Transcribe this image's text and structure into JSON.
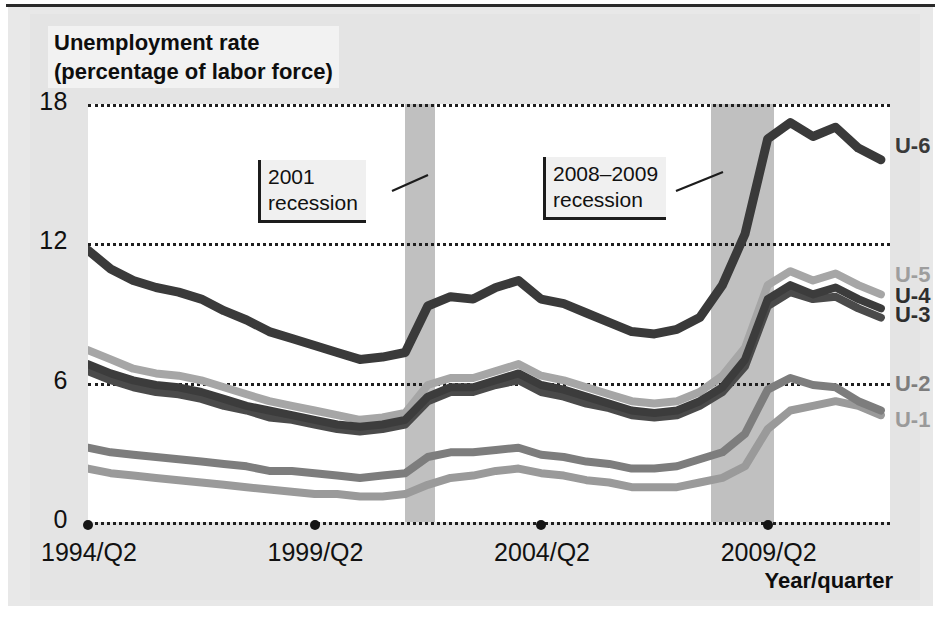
{
  "title": {
    "line1": "Unemployment rate",
    "line2": "(percentage of labor force)"
  },
  "axis": {
    "x_title": "Year/quarter",
    "y_ticks": [
      "0",
      "6",
      "12",
      "18"
    ],
    "x_ticks": [
      "1994/Q2",
      "1999/Q2",
      "2004/Q2",
      "2009/Q2"
    ]
  },
  "annotations": [
    {
      "line1": "2001",
      "line2": "recession"
    },
    {
      "line1": "2008–2009",
      "line2": "recession"
    }
  ],
  "series_labels": [
    "U-6",
    "U-5",
    "U-4",
    "U-3",
    "U-2",
    "U-1"
  ],
  "colors": {
    "u1": "#9a9a9a",
    "u2": "#7d7d7d",
    "u3": "#4a4a4a",
    "u4": "#3c3c3c",
    "u5": "#a6a6a6",
    "u6": "#3a3a3a",
    "recession_band": "#c0c0c0",
    "plot_background": "#ffffff",
    "figure_background": "#e8e8e8",
    "gridline": "#1f1f1f",
    "text": "#111111"
  },
  "chart_data": {
    "type": "line",
    "title": "Unemployment rate (percentage of labor force)",
    "xlabel": "Year/quarter",
    "ylabel": "Unemployment rate (percentage of labor force)",
    "ylim": [
      0,
      18
    ],
    "xlim": [
      "1994/Q2",
      "2011/Q4"
    ],
    "grid": true,
    "gridlines_y": [
      0,
      6,
      12,
      18
    ],
    "legend_position": "right-inline-end-labels",
    "x_tick_labels": [
      "1994/Q2",
      "1999/Q2",
      "2004/Q2",
      "2009/Q2"
    ],
    "x_tick_values": [
      1994.25,
      1999.25,
      2004.25,
      2009.25
    ],
    "shaded_regions": [
      {
        "label": "2001 recession",
        "start": 2001.25,
        "end": 2001.9
      },
      {
        "label": "2008-2009 recession",
        "start": 2008.0,
        "end": 2009.4
      }
    ],
    "x": [
      1994.25,
      1994.75,
      1995.25,
      1995.75,
      1996.25,
      1996.75,
      1997.25,
      1997.75,
      1998.25,
      1998.75,
      1999.25,
      1999.75,
      2000.25,
      2000.75,
      2001.25,
      2001.75,
      2002.25,
      2002.75,
      2003.25,
      2003.75,
      2004.25,
      2004.75,
      2005.25,
      2005.75,
      2006.25,
      2006.75,
      2007.25,
      2007.75,
      2008.25,
      2008.75,
      2009.25,
      2009.75,
      2010.25,
      2010.75,
      2011.25,
      2011.75
    ],
    "series": [
      {
        "name": "U-6",
        "color": "#3a3a3a",
        "values": [
          11.7,
          10.9,
          10.4,
          10.1,
          9.9,
          9.6,
          9.1,
          8.7,
          8.2,
          7.9,
          7.6,
          7.3,
          7.0,
          7.1,
          7.3,
          9.3,
          9.7,
          9.6,
          10.1,
          10.4,
          9.6,
          9.4,
          9.0,
          8.6,
          8.2,
          8.1,
          8.3,
          8.8,
          10.2,
          12.4,
          16.5,
          17.2,
          16.6,
          17.0,
          16.1,
          15.6
        ]
      },
      {
        "name": "U-5",
        "color": "#a6a6a6",
        "values": [
          7.4,
          7.0,
          6.6,
          6.4,
          6.3,
          6.1,
          5.8,
          5.5,
          5.2,
          5.0,
          4.8,
          4.6,
          4.4,
          4.5,
          4.7,
          5.9,
          6.2,
          6.2,
          6.5,
          6.8,
          6.3,
          6.1,
          5.8,
          5.5,
          5.2,
          5.1,
          5.2,
          5.6,
          6.3,
          7.5,
          10.2,
          10.8,
          10.4,
          10.7,
          10.2,
          9.8
        ]
      },
      {
        "name": "U-4",
        "color": "#3c3c3c",
        "values": [
          6.8,
          6.4,
          6.1,
          5.9,
          5.8,
          5.6,
          5.3,
          5.0,
          4.8,
          4.6,
          4.4,
          4.2,
          4.1,
          4.2,
          4.4,
          5.4,
          5.8,
          5.8,
          6.1,
          6.4,
          5.9,
          5.7,
          5.4,
          5.1,
          4.8,
          4.7,
          4.8,
          5.2,
          5.8,
          7.0,
          9.6,
          10.2,
          9.8,
          10.1,
          9.6,
          9.2
        ]
      },
      {
        "name": "U-3",
        "color": "#4a4a4a",
        "values": [
          6.5,
          6.1,
          5.8,
          5.6,
          5.5,
          5.3,
          5.0,
          4.8,
          4.5,
          4.4,
          4.2,
          4.0,
          3.9,
          4.0,
          4.2,
          5.2,
          5.6,
          5.6,
          5.9,
          6.1,
          5.6,
          5.4,
          5.1,
          4.9,
          4.6,
          4.5,
          4.6,
          5.0,
          5.6,
          6.7,
          9.3,
          9.9,
          9.6,
          9.7,
          9.2,
          8.8
        ]
      },
      {
        "name": "U-2",
        "color": "#7d7d7d",
        "values": [
          3.2,
          3.0,
          2.9,
          2.8,
          2.7,
          2.6,
          2.5,
          2.4,
          2.2,
          2.2,
          2.1,
          2.0,
          1.9,
          2.0,
          2.1,
          2.8,
          3.0,
          3.0,
          3.1,
          3.2,
          2.9,
          2.8,
          2.6,
          2.5,
          2.3,
          2.3,
          2.4,
          2.7,
          3.0,
          3.8,
          5.7,
          6.2,
          5.9,
          5.8,
          5.2,
          4.8
        ]
      },
      {
        "name": "U-1",
        "color": "#9a9a9a",
        "values": [
          2.3,
          2.1,
          2.0,
          1.9,
          1.8,
          1.7,
          1.6,
          1.5,
          1.4,
          1.3,
          1.2,
          1.2,
          1.1,
          1.1,
          1.2,
          1.6,
          1.9,
          2.0,
          2.2,
          2.3,
          2.1,
          2.0,
          1.8,
          1.7,
          1.5,
          1.5,
          1.5,
          1.7,
          1.9,
          2.4,
          4.0,
          4.8,
          5.0,
          5.2,
          5.0,
          4.6
        ]
      }
    ]
  }
}
